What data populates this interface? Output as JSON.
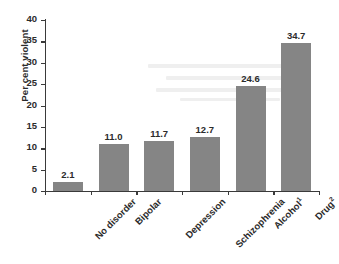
{
  "chart_data": {
    "type": "bar",
    "title": "",
    "xlabel": "",
    "ylabel": "Per cent violent",
    "ylim": [
      0,
      40
    ],
    "ytick_step": 5,
    "yticks": [
      40,
      35,
      30,
      25,
      20,
      15,
      10,
      5,
      0
    ],
    "grid": false,
    "legend": "none",
    "bar_color": "#858585",
    "axis_color": "#3a3a3a",
    "categories": [
      "No disorder",
      "Bipolar",
      "Depression",
      "Schizophrenia",
      "Alcohol",
      "Drug"
    ],
    "category_footnotes": [
      "",
      "",
      "",
      "",
      "1",
      "2"
    ],
    "values": [
      2.1,
      11.0,
      11.7,
      12.7,
      24.6,
      34.7
    ],
    "value_labels": [
      "2.1",
      "11.0",
      "11.7",
      "12.7",
      "24.6",
      "34.7"
    ]
  }
}
